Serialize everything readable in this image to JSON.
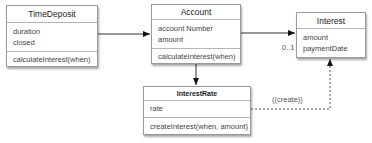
{
  "classes": {
    "time_deposit": {
      "name": "TimeDeposit",
      "attributes": [
        "duration",
        "closed"
      ],
      "methods": [
        "calculateInterest(when)"
      ]
    },
    "account": {
      "name": "Account",
      "attributes": [
        "account Number",
        "amount"
      ],
      "methods": [
        "calculateInterest(when)"
      ]
    },
    "interest": {
      "name": "Interest",
      "attributes": [
        "amount",
        "paymentDate"
      ],
      "methods": []
    },
    "interest_rate": {
      "name": "InterestRate",
      "attributes": [
        "rate"
      ],
      "methods": [
        "createInterest(when, amount)"
      ]
    }
  },
  "connections": {
    "account_to_interest_multiplicity": "0..1",
    "create_stereotype": "««create»»"
  },
  "labels": {
    "multiplicity": "0..1",
    "create": "((create))"
  }
}
